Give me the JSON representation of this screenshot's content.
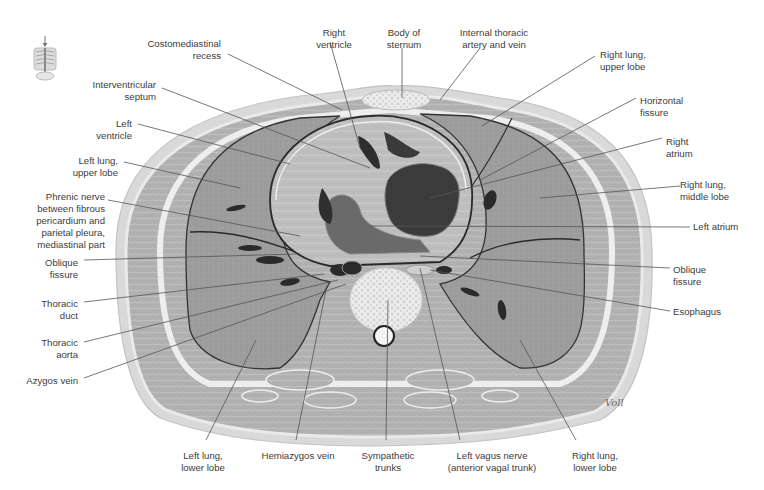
{
  "figure": {
    "signature": "Voll",
    "orientation_icon": "thorax-orientation-thumbnail",
    "colors": {
      "background": "#ffffff",
      "lung": "#9a9a9a",
      "muscle": "#b3b3b3",
      "fat_fascia": "#e6e6e6",
      "skin": "#d4d4d4",
      "cavity_dark": "#3a3a3a",
      "leader_line": "#555555",
      "label_text": "#3c3c3c"
    }
  },
  "labels": {
    "left": [
      {
        "id": "costomediastinal-recess",
        "text": "Costomediastinal\nrecess"
      },
      {
        "id": "interventricular-septum",
        "text": "Interventricular\nseptum"
      },
      {
        "id": "left-ventricle",
        "text": "Left\nventricle"
      },
      {
        "id": "left-lung-upper-lobe",
        "text": "Left lung,\nupper lobe"
      },
      {
        "id": "phrenic-nerve",
        "text": "Phrenic nerve\nbetween fibrous\npericardium and\nparietal pleura,\nmediastinal part"
      },
      {
        "id": "oblique-fissure-left",
        "text": "Oblique\nfissure"
      },
      {
        "id": "thoracic-duct",
        "text": "Thoracic\nduct"
      },
      {
        "id": "thoracic-aorta",
        "text": "Thoracic\naorta"
      },
      {
        "id": "azygos-vein",
        "text": "Azygos vein"
      }
    ],
    "top": [
      {
        "id": "right-ventricle",
        "text": "Right\nventricle"
      },
      {
        "id": "body-of-sternum",
        "text": "Body of\nsternum"
      },
      {
        "id": "internal-thoracic",
        "text": "Internal thoracic\nartery and vein"
      }
    ],
    "right": [
      {
        "id": "right-lung-upper-lobe",
        "text": "Right lung,\nupper lobe"
      },
      {
        "id": "horizontal-fissure",
        "text": "Horizontal\nfissure"
      },
      {
        "id": "right-atrium",
        "text": "Right\natrium"
      },
      {
        "id": "right-lung-middle-lobe",
        "text": "Right lung,\nmiddle lobe"
      },
      {
        "id": "left-atrium",
        "text": "Left atrium"
      },
      {
        "id": "oblique-fissure-right",
        "text": "Oblique\nfissure"
      },
      {
        "id": "esophagus",
        "text": "Esophagus"
      }
    ],
    "bottom": [
      {
        "id": "left-lung-lower-lobe",
        "text": "Left lung,\nlower lobe"
      },
      {
        "id": "hemiazygos-vein",
        "text": "Hemiazygos vein"
      },
      {
        "id": "sympathetic-trunks",
        "text": "Sympathetic\ntrunks"
      },
      {
        "id": "left-vagus-nerve",
        "text": "Left vagus nerve\n(anterior vagal trunk)"
      },
      {
        "id": "right-lung-lower-lobe",
        "text": "Right lung,\nlower lobe"
      }
    ]
  }
}
